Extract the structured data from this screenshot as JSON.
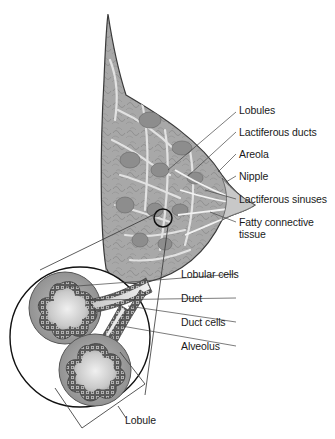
{
  "colors": {
    "tissue_fill": "#a9a9a9",
    "tissue_dark": "#8c8c8c",
    "fat_light": "#d6d6d6",
    "outline": "#3a3a3a",
    "leader_line": "#444444",
    "background": "#ffffff"
  },
  "labels": {
    "lobules": "Lobules",
    "lactiferous_ducts": "Lactiferous ducts",
    "areola": "Areola",
    "nipple": "Nipple",
    "lactiferous_sinuses": "Lactiferous sinuses",
    "fatty_connective_tissue_line1": "Fatty connective",
    "fatty_connective_tissue_line2": "tissue",
    "lobular_cells": "Lobular cells",
    "duct": "Duct",
    "duct_cells": "Duct cells",
    "alveolus": "Alveolus",
    "lobule": "Lobule"
  }
}
